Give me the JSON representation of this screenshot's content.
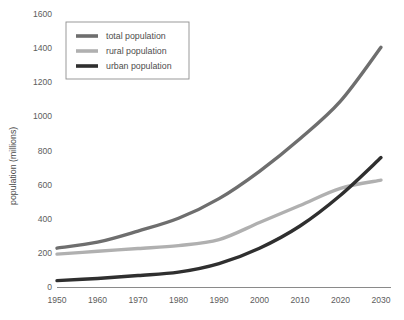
{
  "chart_data": {
    "type": "line",
    "title": "",
    "xlabel": "",
    "ylabel": "population (millions)",
    "x": [
      1950,
      1960,
      1970,
      1980,
      1990,
      2000,
      2010,
      2020,
      2030
    ],
    "xtick_labels": [
      "1950",
      "1960",
      "1970",
      "1980",
      "1990",
      "2000",
      "2010",
      "2020",
      "2030"
    ],
    "ytick_labels": [
      "0",
      "200",
      "400",
      "600",
      "800",
      "1000",
      "1200",
      "1400",
      "1600"
    ],
    "yticks": [
      0,
      200,
      400,
      600,
      800,
      1000,
      1200,
      1400,
      1600
    ],
    "xlim": [
      1950,
      2030
    ],
    "ylim": [
      0,
      1600
    ],
    "grid": false,
    "legend_position": "top-left",
    "series": [
      {
        "name": "total population",
        "color": "#6e6e6e",
        "values": [
          230,
          265,
          330,
          405,
          520,
          680,
          870,
          1090,
          1405
        ]
      },
      {
        "name": "rural population",
        "color": "#b0b0b0",
        "values": [
          195,
          212,
          228,
          245,
          280,
          380,
          480,
          580,
          628
        ]
      },
      {
        "name": "urban population",
        "color": "#2f2f2f",
        "values": [
          40,
          53,
          70,
          90,
          140,
          230,
          360,
          540,
          760
        ]
      }
    ]
  },
  "legend": {
    "items": [
      {
        "label": "total population"
      },
      {
        "label": "rural population"
      },
      {
        "label": "urban population"
      }
    ]
  },
  "axes": {
    "y_axis_title": "population (millions)"
  },
  "colors": {
    "total": "#6e6e6e",
    "rural": "#b0b0b0",
    "urban": "#2f2f2f",
    "axis": "#8a8a8a",
    "text": "#5d5d5d",
    "background": "#ffffff"
  }
}
